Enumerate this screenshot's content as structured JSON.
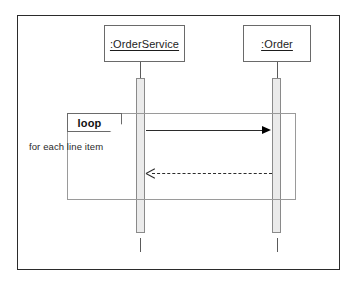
{
  "diagram": {
    "kind": "uml-sequence-diagram",
    "background_color": "#ffffff",
    "frame_color": "#2b2b2b",
    "participants": [
      {
        "id": "orderservice",
        "label": ":OrderService"
      },
      {
        "id": "order",
        "label": ":Order"
      }
    ],
    "fragment": {
      "operator": "loop",
      "guard": "for each line item",
      "border_color": "#9a9a9a"
    },
    "messages": [
      {
        "id": "call",
        "from": "orderservice",
        "to": "order",
        "label": "",
        "style": "solid",
        "arrow": "filled",
        "direction": "right"
      },
      {
        "id": "return",
        "from": "order",
        "to": "orderservice",
        "label": "",
        "style": "dashed",
        "arrow": "open",
        "direction": "left"
      }
    ],
    "activations": [
      {
        "participant": "orderservice",
        "fill": "#ebebeb"
      },
      {
        "participant": "order",
        "fill": "#ebebeb"
      }
    ]
  }
}
